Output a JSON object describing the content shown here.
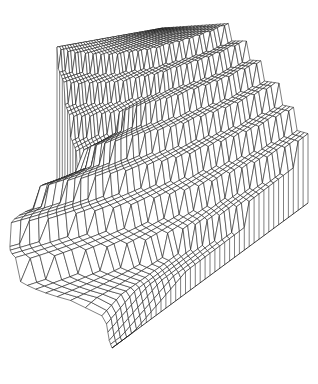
{
  "page": {
    "background": "#ffffff",
    "width": 318,
    "height": 384
  },
  "figure": {
    "kind": "hidden-line 3D mesh figure",
    "background": "#ffffff",
    "line_color": "#161616",
    "fill_color": "#ffffff",
    "stroke_width": 0.55,
    "edge_stroke_width": 0.85
  },
  "chart_data": {
    "type": "wireframe-surface-3d",
    "title": "",
    "axes_visible": false,
    "legend_visible": false,
    "grid": {
      "n": 40
    },
    "surface": {
      "step_axis": "w = u - gamma*v",
      "gamma": 0.45,
      "levels": [
        1,
        0.875,
        0.75,
        0.625,
        0.5,
        0.375,
        0.25,
        0.125,
        0
      ],
      "n_terraces": 8,
      "first_step_w": 0.02,
      "step_spacing_w": 0.112,
      "ramp_start_w": 0.83,
      "ramp_end_w": 0.95
    },
    "projection": {
      "base_corners": {
        "back_left": [
          57,
          195
        ],
        "back_right": [
          163,
          131
        ],
        "front_tip": [
          112,
          348
        ],
        "right": [
          308,
          203
        ]
      },
      "height_scale_px": {
        "back_left": 148,
        "back_right": 103,
        "right": 185,
        "front_tip": 170
      },
      "left_bulge": {
        "amp": 1300,
        "u_start": 0.38,
        "u_end": 0.88,
        "v_falloff_power": 3
      }
    },
    "walls": {
      "back_wall": {
        "style": "vertical-lines",
        "hangs_from": "back top edge (z=1)",
        "drops_to": "base plane"
      },
      "right_skirt": {
        "style": "vertical-lines",
        "hangs_from": "front-right surface edge",
        "drops_to": "straight base line"
      }
    }
  }
}
